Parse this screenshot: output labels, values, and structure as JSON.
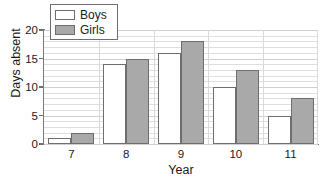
{
  "chart_data": {
    "type": "bar",
    "title": "",
    "xlabel": "Year",
    "ylabel": "Days absent",
    "categories": [
      "7",
      "8",
      "9",
      "10",
      "11"
    ],
    "series": [
      {
        "name": "Boys",
        "values": [
          1,
          14,
          16,
          10,
          5
        ],
        "color": "#ffffff"
      },
      {
        "name": "Girls",
        "values": [
          2,
          15,
          18,
          13,
          8
        ],
        "color": "#a9a9a9"
      }
    ],
    "ylim": [
      0,
      20
    ],
    "yticks": [
      0,
      5,
      10,
      15,
      20
    ],
    "ytick_labels": [
      "0",
      "5",
      "10",
      "15",
      "20"
    ],
    "grid": true,
    "grid_minor_step": 1,
    "legend_position": "top-left",
    "bar_outline_color": "#6e6e6e"
  }
}
